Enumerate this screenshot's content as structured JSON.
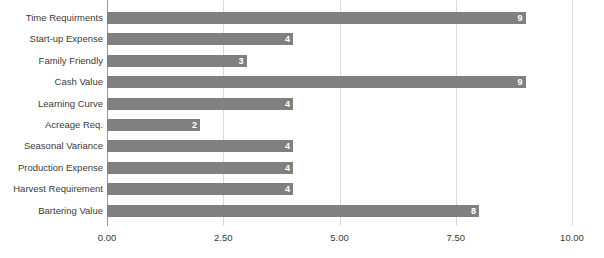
{
  "chart_data": {
    "type": "bar",
    "orientation": "horizontal",
    "title": "",
    "subtitle": "",
    "xlabel": "",
    "ylabel": "",
    "xlim": [
      0,
      10
    ],
    "ylim": null,
    "grid": true,
    "legend": null,
    "legend_position": "none",
    "categories": [
      "Time Requirments",
      "Start-up Expense",
      "Family Friendly",
      "Cash Value",
      "Learning Curve",
      "Acreage Req.",
      "Seasonal Variance",
      "Production Expense",
      "Harvest Requirement",
      "Bartering Value"
    ],
    "values": [
      9,
      4,
      3,
      9,
      4,
      2,
      4,
      4,
      4,
      8
    ],
    "data_labels": [
      "9",
      "4",
      "3",
      "9",
      "4",
      "2",
      "4",
      "4",
      "4",
      "8"
    ],
    "xticks": [
      0,
      2.5,
      5,
      7.5,
      10
    ],
    "xtick_labels": [
      "0.00",
      "2.50",
      "5.00",
      "7.50",
      "10.00"
    ],
    "colors": {
      "bar": "#808080",
      "gridline": "#d9d9d9",
      "axis_line": "#9a9a9a",
      "data_label_text": "#ffffff",
      "category_label_text": "#3a3a3a",
      "tick_label_text": "#3a3a3a",
      "background": "#ffffff"
    }
  }
}
